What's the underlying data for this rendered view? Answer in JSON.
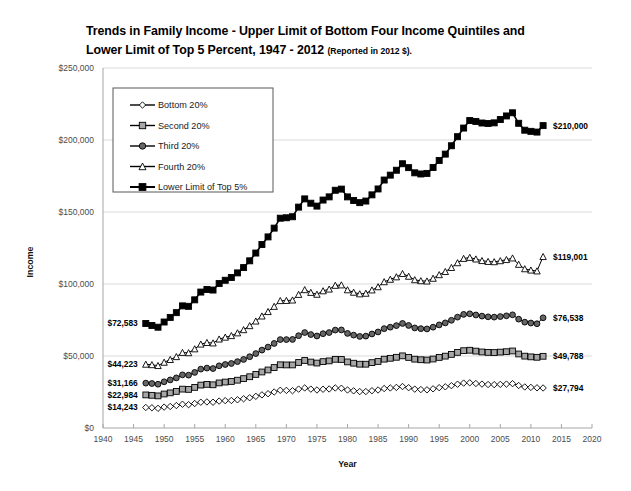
{
  "title": {
    "line1": "Trends in Family Income - Upper Limit of Bottom Four Income Quintiles and",
    "line2": "Lower Limit of Top 5 Percent, 1947 - 2012",
    "note": "(Reported in 2012 $)."
  },
  "axes": {
    "xlabel": "Year",
    "ylabel": "Income"
  },
  "legend": {
    "items": [
      {
        "label": "Bottom 20%"
      },
      {
        "label": "Second 20%"
      },
      {
        "label": "Third 20%"
      },
      {
        "label": "Fourth 20%"
      },
      {
        "label": "Lower Limit of Top 5%"
      }
    ]
  },
  "start_labels": [
    {
      "text": "$72,583"
    },
    {
      "text": "$44,223"
    },
    {
      "text": "$31,166"
    },
    {
      "text": "$22,984"
    },
    {
      "text": "$14,243"
    }
  ],
  "end_labels": [
    {
      "text": "$210,000"
    },
    {
      "text": "$119,001"
    },
    {
      "text": "$76,538"
    },
    {
      "text": "$49,788"
    },
    {
      "text": "$27,794"
    }
  ],
  "chart_data": {
    "type": "line",
    "title": "Trends in Family Income - Upper Limit of Bottom Four Income Quintiles and Lower Limit of Top 5 Percent, 1947 - 2012 (Reported in 2012 $).",
    "xlabel": "Year",
    "ylabel": "Income",
    "xlim": [
      1940,
      2020
    ],
    "ylim": [
      0,
      250000
    ],
    "xticks": [
      1940,
      1945,
      1950,
      1955,
      1960,
      1965,
      1970,
      1975,
      1980,
      1985,
      1990,
      1995,
      2000,
      2005,
      2010,
      2015,
      2020
    ],
    "xtick_labels": [
      "1940",
      "1945",
      "1950",
      "1955",
      "1960",
      "1965",
      "1970",
      "1975",
      "1980",
      "1985",
      "1990",
      "1995",
      "2000",
      "2005",
      "2010",
      "2015",
      "2020"
    ],
    "yticks": [
      0,
      50000,
      100000,
      150000,
      200000,
      250000
    ],
    "ytick_labels": [
      "$0",
      "$50,000",
      "$100,000",
      "$150,000",
      "$200,000",
      "$250,000"
    ],
    "grid": "horizontal",
    "legend_position": "upper-left-inside",
    "x": [
      1947,
      1948,
      1949,
      1950,
      1951,
      1952,
      1953,
      1954,
      1955,
      1956,
      1957,
      1958,
      1959,
      1960,
      1961,
      1962,
      1963,
      1964,
      1965,
      1966,
      1967,
      1968,
      1969,
      1970,
      1971,
      1972,
      1973,
      1974,
      1975,
      1976,
      1977,
      1978,
      1979,
      1980,
      1981,
      1982,
      1983,
      1984,
      1985,
      1986,
      1987,
      1988,
      1989,
      1990,
      1991,
      1992,
      1993,
      1994,
      1995,
      1996,
      1997,
      1998,
      1999,
      2000,
      2001,
      2002,
      2003,
      2004,
      2005,
      2006,
      2007,
      2008,
      2009,
      2010,
      2011,
      2012
    ],
    "series": [
      {
        "name": "Bottom 20%",
        "marker": "diamond",
        "marker_fill": "#ffffff",
        "start_value": 14243,
        "end_value": 27794,
        "values": [
          14243,
          14050,
          13650,
          14500,
          14950,
          15600,
          16500,
          16200,
          17000,
          17900,
          18100,
          17900,
          18700,
          19000,
          19100,
          19600,
          20300,
          21000,
          22000,
          23000,
          23800,
          25000,
          26200,
          26100,
          25900,
          27000,
          27800,
          27000,
          26400,
          26900,
          27100,
          27800,
          27600,
          26400,
          25800,
          25300,
          25300,
          25900,
          26400,
          27400,
          27800,
          28200,
          28800,
          28000,
          27000,
          26700,
          26500,
          27200,
          28000,
          28600,
          29400,
          30400,
          31200,
          31400,
          30900,
          30500,
          30200,
          30100,
          30300,
          30500,
          30800,
          29500,
          28500,
          28200,
          27900,
          27794
        ]
      },
      {
        "name": "Second 20%",
        "marker": "square",
        "marker_fill": "#a6a6a6",
        "start_value": 22984,
        "end_value": 49788,
        "values": [
          22984,
          22700,
          22300,
          23600,
          24400,
          25400,
          27000,
          26800,
          28200,
          29800,
          30300,
          30000,
          31300,
          31900,
          32300,
          33200,
          34300,
          35600,
          37200,
          38900,
          40300,
          42000,
          43900,
          43800,
          43800,
          45500,
          46900,
          45800,
          45100,
          46100,
          46600,
          47700,
          47600,
          45900,
          45000,
          44300,
          44300,
          45400,
          46200,
          47800,
          48400,
          49100,
          50100,
          49000,
          47800,
          47400,
          47200,
          47900,
          49000,
          49900,
          51100,
          52500,
          53700,
          54000,
          53400,
          52800,
          52500,
          52400,
          52700,
          53000,
          53500,
          51400,
          49900,
          49400,
          49100,
          49788
        ]
      },
      {
        "name": "Third 20%",
        "marker": "circle",
        "marker_fill": "#666666",
        "start_value": 31166,
        "end_value": 76538,
        "values": [
          31166,
          30900,
          30400,
          32100,
          33400,
          34800,
          36900,
          36700,
          38600,
          40900,
          41600,
          41300,
          43200,
          44100,
          44800,
          46100,
          47600,
          49500,
          51700,
          54100,
          56200,
          58700,
          61400,
          61400,
          61500,
          64100,
          66300,
          64900,
          63900,
          65500,
          66300,
          68000,
          68100,
          65700,
          64500,
          63600,
          63800,
          65300,
          66700,
          69000,
          70000,
          71100,
          72600,
          71200,
          69500,
          69000,
          68800,
          70000,
          71600,
          73000,
          74800,
          77000,
          78900,
          79300,
          78500,
          77700,
          77200,
          77000,
          77400,
          77900,
          78600,
          75600,
          73500,
          72900,
          72400,
          76538
        ]
      },
      {
        "name": "Fourth 20%",
        "marker": "triangle",
        "marker_fill": "#ffffff",
        "start_value": 44223,
        "end_value": 119001,
        "values": [
          44223,
          43900,
          43300,
          45600,
          47500,
          49500,
          52400,
          52200,
          54900,
          58200,
          59300,
          59000,
          61700,
          63000,
          64100,
          66000,
          68200,
          71000,
          74200,
          77700,
          80800,
          84400,
          88400,
          88500,
          88800,
          92700,
          96000,
          94100,
          92800,
          95200,
          96400,
          99000,
          99300,
          95900,
          94200,
          93100,
          93500,
          95800,
          98000,
          101500,
          103200,
          104900,
          107200,
          105300,
          102900,
          102200,
          102000,
          103900,
          106400,
          108600,
          111400,
          114700,
          117700,
          118400,
          117300,
          116200,
          115600,
          115400,
          116100,
          116900,
          118000,
          113600,
          110500,
          109600,
          109000,
          119001
        ]
      },
      {
        "name": "Lower Limit of Top 5%",
        "marker": "square",
        "marker_fill": "#000000",
        "start_value": 72583,
        "end_value": 210000,
        "values": [
          72583,
          71200,
          70000,
          73600,
          76800,
          80100,
          84800,
          84500,
          89000,
          94400,
          96200,
          95800,
          100300,
          102600,
          104500,
          107700,
          111400,
          116100,
          121500,
          127400,
          132700,
          138800,
          145700,
          146000,
          146700,
          153400,
          159100,
          156100,
          154100,
          158300,
          160500,
          165100,
          165900,
          160500,
          158000,
          156500,
          157600,
          161900,
          166000,
          172200,
          175600,
          179000,
          183500,
          180800,
          177200,
          176400,
          176800,
          180900,
          185800,
          190200,
          196000,
          202300,
          208300,
          213500,
          212900,
          211800,
          211500,
          211900,
          214200,
          216700,
          218900,
          211600,
          206800,
          206000,
          205500,
          210000
        ]
      }
    ]
  }
}
